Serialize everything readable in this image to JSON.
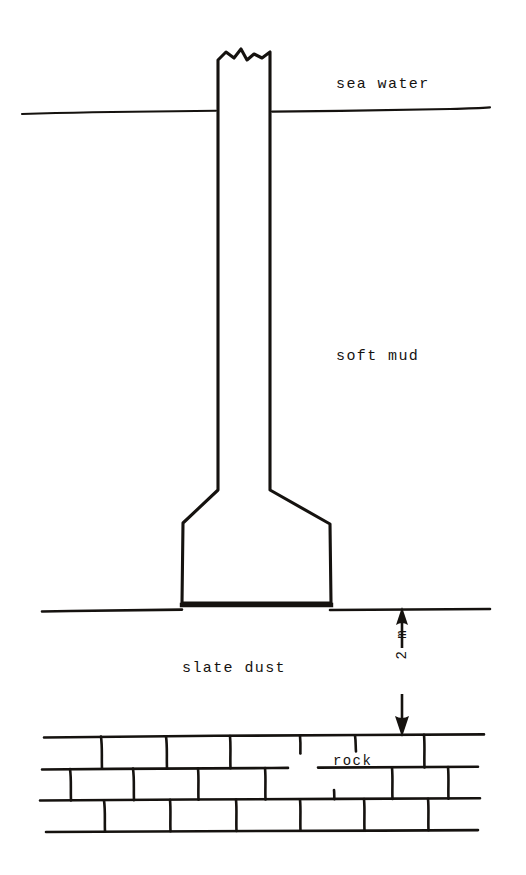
{
  "figure": {
    "stroke_color": "#15120f",
    "background_color": "#ffffff",
    "labels": {
      "sea_water": "sea water",
      "soft_mud": "soft mud",
      "slate_dust": "slate dust",
      "rock": "rock",
      "dimension": "2 m"
    },
    "strata": [
      {
        "name": "sea water",
        "order": 1
      },
      {
        "name": "soft mud",
        "order": 2
      },
      {
        "name": "slate dust",
        "order": 3,
        "thickness": "2 m"
      },
      {
        "name": "rock",
        "order": 4
      }
    ],
    "dimension": {
      "value": 2,
      "unit": "m",
      "text": "2 m",
      "orientation": "vertical",
      "arrow_style": "double-headed",
      "measures": "slate dust layer thickness"
    },
    "structure": {
      "type": "pier-column-with-spread-footing",
      "top_symbol": "break-line",
      "shaft_width_px": 52,
      "base_width_px": 148
    }
  }
}
